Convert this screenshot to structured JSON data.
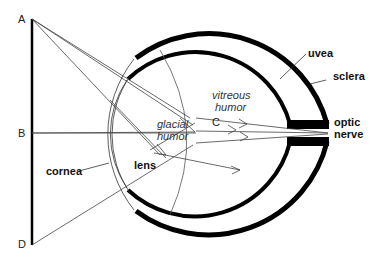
{
  "diagram": {
    "points": {
      "A": "A",
      "B": "B",
      "C": "C",
      "D": "D"
    },
    "labels": {
      "uvea": "uvea",
      "sclera": "sclera",
      "optic_line1": "optic",
      "optic_line2": "nerve",
      "vitreous_line1": "vitreous",
      "vitreous_line2": "humor",
      "glacial_line1": "glacial",
      "glacial_line2": "humor",
      "lens": "lens",
      "cornea": "cornea"
    },
    "colors": {
      "structure": "#000000",
      "ray": "#444444",
      "background": "#ffffff"
    }
  }
}
